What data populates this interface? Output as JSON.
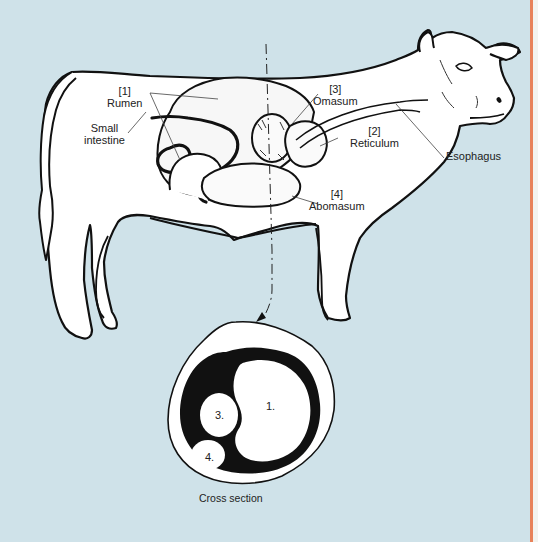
{
  "figure": {
    "colors": {
      "background": "#cfe2e9",
      "border_accent": "#e8825a",
      "ink": "#111111",
      "body_fill": "#ffffff"
    },
    "labels": {
      "rumen_num": "[1]",
      "rumen": "Rumen",
      "small_intestine_line1": "Small",
      "small_intestine_line2": "intestine",
      "omasum_num": "[3]",
      "omasum": "Omasum",
      "reticulum_num": "[2]",
      "reticulum": "Reticulum",
      "esophagus": "Esophagus",
      "abomasum_num": "[4]",
      "abomasum": "Abomasum"
    },
    "cross_section": {
      "caption": "Cross section",
      "compartments": [
        {
          "id": "1",
          "label": "1.",
          "name": "Rumen"
        },
        {
          "id": "3",
          "label": "3.",
          "name": "Omasum"
        },
        {
          "id": "4",
          "label": "4.",
          "name": "Abomasum"
        }
      ]
    }
  }
}
